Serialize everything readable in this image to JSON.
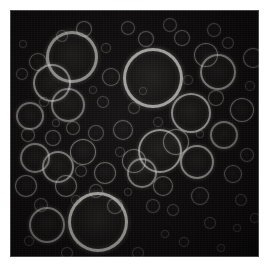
{
  "figure": {
    "caption": "",
    "background_color": "#0b0909",
    "page_color": "#ffffff",
    "ring_color": "#8a8a8a",
    "frame": {
      "x": 10,
      "y": 10,
      "width": 249,
      "height": 247
    },
    "canvas": {
      "width": 271,
      "height": 271
    }
  },
  "chart_data": {
    "type": "scatter",
    "xlabel": "",
    "ylabel": "",
    "xlim": [
      0,
      249
    ],
    "ylim": [
      0,
      247
    ],
    "grid": false,
    "legend": "none",
    "units": "pixels",
    "droplets": [
      {
        "cx": 62,
        "cy": 47,
        "r": 26,
        "b": 0.62
      },
      {
        "cx": 143,
        "cy": 68,
        "r": 30,
        "b": 0.72
      },
      {
        "cx": 88,
        "cy": 212,
        "r": 30,
        "b": 0.7
      },
      {
        "cx": 150,
        "cy": 141,
        "r": 22,
        "b": 0.62
      },
      {
        "cx": 181,
        "cy": 103,
        "r": 20,
        "b": 0.6
      },
      {
        "cx": 42,
        "cy": 73,
        "r": 19,
        "b": 0.55
      },
      {
        "cx": 37,
        "cy": 215,
        "r": 18,
        "b": 0.5
      },
      {
        "cx": 208,
        "cy": 62,
        "r": 18,
        "b": 0.52
      },
      {
        "cx": 187,
        "cy": 152,
        "r": 17,
        "b": 0.55
      },
      {
        "cx": 58,
        "cy": 95,
        "r": 17,
        "b": 0.48
      },
      {
        "cx": 48,
        "cy": 157,
        "r": 16,
        "b": 0.52
      },
      {
        "cx": 132,
        "cy": 163,
        "r": 15,
        "b": 0.5
      },
      {
        "cx": 25,
        "cy": 148,
        "r": 15,
        "b": 0.48
      },
      {
        "cx": 214,
        "cy": 125,
        "r": 14,
        "b": 0.46
      },
      {
        "cx": 20,
        "cy": 106,
        "r": 14,
        "b": 0.45
      },
      {
        "cx": 73,
        "cy": 142,
        "r": 13,
        "b": 0.46
      },
      {
        "cx": 166,
        "cy": 132,
        "r": 13,
        "b": 0.44
      },
      {
        "cx": 124,
        "cy": 151,
        "r": 12,
        "b": 0.42
      },
      {
        "cx": 232,
        "cy": 100,
        "r": 12,
        "b": 0.42
      },
      {
        "cx": 196,
        "cy": 45,
        "r": 12,
        "b": 0.4
      },
      {
        "cx": 16,
        "cy": 176,
        "r": 11,
        "b": 0.4
      },
      {
        "cx": 95,
        "cy": 163,
        "r": 11,
        "b": 0.38
      },
      {
        "cx": 56,
        "cy": 176,
        "r": 11,
        "b": 0.4
      },
      {
        "cx": 153,
        "cy": 176,
        "r": 10,
        "b": 0.38
      },
      {
        "cx": 113,
        "cy": 120,
        "r": 10,
        "b": 0.36
      },
      {
        "cx": 243,
        "cy": 48,
        "r": 10,
        "b": 0.36
      },
      {
        "cx": 101,
        "cy": 67,
        "r": 9,
        "b": 0.34
      },
      {
        "cx": 28,
        "cy": 52,
        "r": 9,
        "b": 0.34
      },
      {
        "cx": 223,
        "cy": 164,
        "r": 9,
        "b": 0.32
      },
      {
        "cx": 190,
        "cy": 186,
        "r": 9,
        "b": 0.3
      },
      {
        "cx": 74,
        "cy": 19,
        "r": 8,
        "b": 0.34
      },
      {
        "cx": 136,
        "cy": 29,
        "r": 8,
        "b": 0.32
      },
      {
        "cx": 172,
        "cy": 28,
        "r": 8,
        "b": 0.3
      },
      {
        "cx": 43,
        "cy": 128,
        "r": 8,
        "b": 0.34
      },
      {
        "cx": 86,
        "cy": 123,
        "r": 8,
        "b": 0.3
      },
      {
        "cx": 105,
        "cy": 196,
        "r": 8,
        "b": 0.3
      },
      {
        "cx": 206,
        "cy": 88,
        "r": 8,
        "b": 0.3
      },
      {
        "cx": 63,
        "cy": 118,
        "r": 7,
        "b": 0.3
      },
      {
        "cx": 18,
        "cy": 125,
        "r": 7,
        "b": 0.3
      },
      {
        "cx": 118,
        "cy": 18,
        "r": 7,
        "b": 0.28
      },
      {
        "cx": 160,
        "cy": 15,
        "r": 7,
        "b": 0.26
      },
      {
        "cx": 86,
        "cy": 181,
        "r": 7,
        "b": 0.28
      },
      {
        "cx": 204,
        "cy": 20,
        "r": 7,
        "b": 0.26
      },
      {
        "cx": 237,
        "cy": 145,
        "r": 7,
        "b": 0.26
      },
      {
        "cx": 31,
        "cy": 195,
        "r": 7,
        "b": 0.26
      },
      {
        "cx": 143,
        "cy": 196,
        "r": 7,
        "b": 0.24
      },
      {
        "cx": 52,
        "cy": 26,
        "r": 6,
        "b": 0.26
      },
      {
        "cx": 93,
        "cy": 92,
        "r": 6,
        "b": 0.24
      },
      {
        "cx": 124,
        "cy": 98,
        "r": 6,
        "b": 0.24
      },
      {
        "cx": 218,
        "cy": 33,
        "r": 6,
        "b": 0.24
      },
      {
        "cx": 71,
        "cy": 161,
        "r": 6,
        "b": 0.26
      },
      {
        "cx": 163,
        "cy": 200,
        "r": 6,
        "b": 0.22
      },
      {
        "cx": 12,
        "cy": 64,
        "r": 6,
        "b": 0.24
      },
      {
        "cx": 231,
        "cy": 190,
        "r": 6,
        "b": 0.2
      },
      {
        "cx": 200,
        "cy": 213,
        "r": 6,
        "b": 0.2
      },
      {
        "cx": 57,
        "cy": 243,
        "r": 6,
        "b": 0.22
      },
      {
        "cx": 128,
        "cy": 243,
        "r": 6,
        "b": 0.2
      },
      {
        "cx": 96,
        "cy": 38,
        "r": 5,
        "b": 0.22
      },
      {
        "cx": 34,
        "cy": 92,
        "r": 5,
        "b": 0.22
      },
      {
        "cx": 110,
        "cy": 142,
        "r": 5,
        "b": 0.22
      },
      {
        "cx": 178,
        "cy": 70,
        "r": 5,
        "b": 0.2
      },
      {
        "cx": 148,
        "cy": 112,
        "r": 5,
        "b": 0.2
      },
      {
        "cx": 66,
        "cy": 190,
        "r": 5,
        "b": 0.2
      },
      {
        "cx": 19,
        "cy": 231,
        "r": 5,
        "b": 0.2
      },
      {
        "cx": 174,
        "cy": 232,
        "r": 5,
        "b": 0.18
      },
      {
        "cx": 245,
        "cy": 208,
        "r": 5,
        "b": 0.18
      },
      {
        "cx": 240,
        "cy": 76,
        "r": 5,
        "b": 0.2
      },
      {
        "cx": 13,
        "cy": 34,
        "r": 4,
        "b": 0.18
      },
      {
        "cx": 83,
        "cy": 80,
        "r": 4,
        "b": 0.18
      },
      {
        "cx": 118,
        "cy": 182,
        "r": 4,
        "b": 0.18
      },
      {
        "cx": 155,
        "cy": 224,
        "r": 4,
        "b": 0.16
      },
      {
        "cx": 211,
        "cy": 238,
        "r": 4,
        "b": 0.16
      },
      {
        "cx": 227,
        "cy": 218,
        "r": 4,
        "b": 0.16
      },
      {
        "cx": 92,
        "cy": 253,
        "r": 4,
        "b": 0.16
      },
      {
        "cx": 46,
        "cy": 113,
        "r": 4,
        "b": 0.2
      },
      {
        "cx": 133,
        "cy": 81,
        "r": 4,
        "b": 0.18
      },
      {
        "cx": 190,
        "cy": 124,
        "r": 4,
        "b": 0.18
      }
    ],
    "summary": {
      "droplet_count": 77,
      "radius_min_px": 4,
      "radius_max_px": 30
    }
  }
}
